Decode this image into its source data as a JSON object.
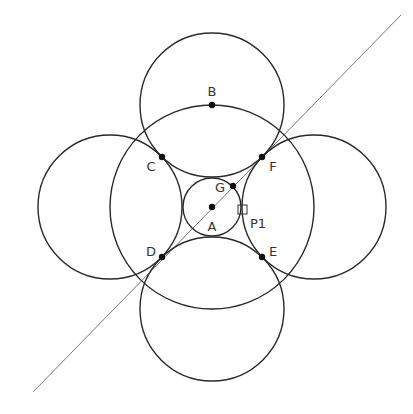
{
  "diagram": {
    "colors": {
      "stroke": "#2a2a2a",
      "line": "#777777",
      "point": "#111111",
      "label": "#333333"
    },
    "line": {
      "x1": 33,
      "y1": 392,
      "x2": 401,
      "y2": 15
    },
    "circles": [
      {
        "name": "big-circle",
        "cx": 212,
        "cy": 207,
        "r": 102
      },
      {
        "name": "small-circle",
        "cx": 212,
        "cy": 207,
        "r": 29
      },
      {
        "name": "top-circle",
        "cx": 212,
        "cy": 105,
        "r": 72
      },
      {
        "name": "bottom-circle",
        "cx": 212,
        "cy": 309,
        "r": 72
      },
      {
        "name": "left-circle",
        "cx": 110,
        "cy": 207,
        "r": 72
      },
      {
        "name": "right-circle",
        "cx": 314,
        "cy": 207,
        "r": 72
      }
    ],
    "points": [
      {
        "id": "A",
        "label": "A",
        "x": 212,
        "y": 207,
        "lx": 212,
        "ly": 231
      },
      {
        "id": "B",
        "label": "B",
        "x": 212,
        "y": 105,
        "lx": 212,
        "ly": 96
      },
      {
        "id": "C",
        "label": "C",
        "x": 162,
        "y": 157,
        "lx": 151,
        "ly": 171
      },
      {
        "id": "D",
        "label": "D",
        "x": 162,
        "y": 257,
        "lx": 151,
        "ly": 256
      },
      {
        "id": "E",
        "label": "E",
        "x": 262,
        "y": 257,
        "lx": 273,
        "ly": 256
      },
      {
        "id": "F",
        "label": "F",
        "x": 262,
        "y": 157,
        "lx": 273,
        "ly": 171
      },
      {
        "id": "G",
        "label": "G",
        "x": 233,
        "y": 186,
        "lx": 220,
        "ly": 192
      }
    ],
    "marker": {
      "id": "P1",
      "label": "P1",
      "x": 238,
      "y": 205,
      "size": 9,
      "lx": 258,
      "ly": 228
    }
  }
}
